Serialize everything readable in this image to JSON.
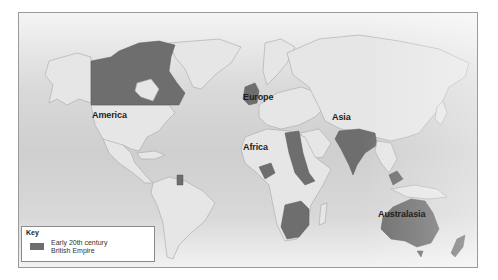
{
  "map": {
    "regions": [
      {
        "id": "america",
        "label": "America"
      },
      {
        "id": "europe",
        "label": "Europe"
      },
      {
        "id": "asia",
        "label": "Asia"
      },
      {
        "id": "africa",
        "label": "Africa"
      },
      {
        "id": "australasia",
        "label": "Australasia"
      }
    ],
    "colors": {
      "empire": "#6e6e6e",
      "land": "#e6e6e6",
      "ocean": "#d4d4d4"
    }
  },
  "key": {
    "title": "Key",
    "items": [
      {
        "label_line1": "Early 20th century",
        "label_line2": "British Empire",
        "color": "#6e6e6e"
      }
    ]
  }
}
